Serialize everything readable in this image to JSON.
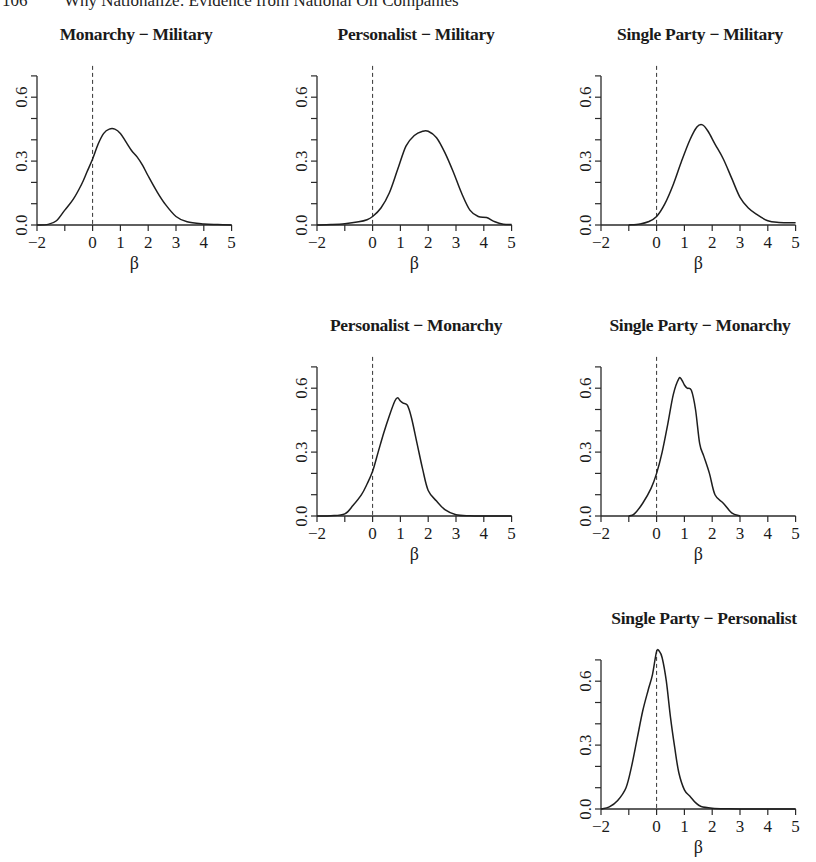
{
  "running_head": {
    "page_number": "106",
    "title": "Why Nationalize: Evidence from National Oil Companies"
  },
  "chart_data": [
    {
      "type": "line",
      "title": "Monarchy − Military",
      "xlabel": "β",
      "ylabel": "",
      "xlim": [
        -2,
        5
      ],
      "ylim": [
        0,
        0.7
      ],
      "xticks": [
        -2,
        -1,
        0,
        1,
        2,
        3,
        4,
        5
      ],
      "xtick_labels": [
        "−2",
        "",
        "0",
        "1",
        "2",
        "3",
        "4",
        "5"
      ],
      "yticks": [
        0.0,
        0.1,
        0.2,
        0.3,
        0.4,
        0.5,
        0.6,
        0.7
      ],
      "ytick_labels": [
        "0.0",
        "",
        "",
        "0.3",
        "",
        "",
        "0.6",
        ""
      ],
      "reference_line_x": 0,
      "x": [
        -2,
        -1.6,
        -1.3,
        -1.0,
        -0.7,
        -0.4,
        -0.2,
        0,
        0.2,
        0.4,
        0.6,
        0.8,
        1.0,
        1.2,
        1.4,
        1.6,
        1.8,
        2.0,
        2.3,
        2.6,
        3.0,
        3.4,
        4.0,
        4.5,
        5.0
      ],
      "y": [
        0.0,
        0.003,
        0.02,
        0.07,
        0.12,
        0.19,
        0.25,
        0.31,
        0.38,
        0.43,
        0.45,
        0.45,
        0.43,
        0.39,
        0.35,
        0.32,
        0.28,
        0.23,
        0.16,
        0.1,
        0.04,
        0.015,
        0.005,
        0.002,
        0.0
      ]
    },
    {
      "type": "line",
      "title": "Personalist − Military",
      "xlabel": "β",
      "ylabel": "",
      "xlim": [
        -2,
        5
      ],
      "ylim": [
        0,
        0.7
      ],
      "xticks": [
        -2,
        -1,
        0,
        1,
        2,
        3,
        4,
        5
      ],
      "xtick_labels": [
        "−2",
        "",
        "0",
        "1",
        "2",
        "3",
        "4",
        "5"
      ],
      "yticks": [
        0.0,
        0.1,
        0.2,
        0.3,
        0.4,
        0.5,
        0.6,
        0.7
      ],
      "ytick_labels": [
        "0.0",
        "",
        "",
        "0.3",
        "",
        "",
        "0.6",
        ""
      ],
      "reference_line_x": 0,
      "x": [
        -2,
        -1.5,
        -1.0,
        -0.5,
        -0.2,
        0,
        0.3,
        0.6,
        0.9,
        1.2,
        1.5,
        1.8,
        2.0,
        2.3,
        2.6,
        2.9,
        3.2,
        3.5,
        3.8,
        4.1,
        4.4,
        4.7,
        5.0
      ],
      "y": [
        0.0,
        0.002,
        0.006,
        0.015,
        0.025,
        0.04,
        0.08,
        0.15,
        0.26,
        0.37,
        0.42,
        0.44,
        0.44,
        0.41,
        0.34,
        0.25,
        0.15,
        0.07,
        0.04,
        0.035,
        0.015,
        0.004,
        0.002
      ]
    },
    {
      "type": "line",
      "title": "Single Party − Military",
      "xlabel": "β",
      "ylabel": "",
      "xlim": [
        -2,
        5
      ],
      "ylim": [
        0,
        0.7
      ],
      "xticks": [
        -2,
        -1,
        0,
        1,
        2,
        3,
        4,
        5
      ],
      "xtick_labels": [
        "−2",
        "",
        "0",
        "1",
        "2",
        "3",
        "4",
        "5"
      ],
      "yticks": [
        0.0,
        0.1,
        0.2,
        0.3,
        0.4,
        0.5,
        0.6,
        0.7
      ],
      "ytick_labels": [
        "0.0",
        "",
        "",
        "0.3",
        "",
        "",
        "0.6",
        ""
      ],
      "reference_line_x": 0,
      "x": [
        -1.0,
        -0.6,
        -0.3,
        0,
        0.3,
        0.6,
        0.9,
        1.2,
        1.45,
        1.65,
        1.85,
        2.1,
        2.4,
        2.7,
        3.0,
        3.3,
        3.6,
        4.0,
        4.4,
        5.0
      ],
      "y": [
        0.0,
        0.005,
        0.015,
        0.04,
        0.1,
        0.19,
        0.3,
        0.4,
        0.46,
        0.47,
        0.44,
        0.38,
        0.31,
        0.22,
        0.13,
        0.08,
        0.05,
        0.02,
        0.012,
        0.01
      ]
    },
    {
      "type": "line",
      "title": "Personalist − Monarchy",
      "xlabel": "β",
      "ylabel": "",
      "xlim": [
        -2,
        5
      ],
      "ylim": [
        0,
        0.7
      ],
      "xticks": [
        -2,
        -1,
        0,
        1,
        2,
        3,
        4,
        5
      ],
      "xtick_labels": [
        "−2",
        "",
        "0",
        "1",
        "2",
        "3",
        "4",
        "5"
      ],
      "yticks": [
        0.0,
        0.1,
        0.2,
        0.3,
        0.4,
        0.5,
        0.6,
        0.7
      ],
      "ytick_labels": [
        "0.0",
        "",
        "",
        "0.3",
        "",
        "",
        "0.6",
        ""
      ],
      "reference_line_x": 0,
      "x": [
        -2,
        -1.5,
        -1.0,
        -0.7,
        -0.4,
        -0.2,
        0,
        0.2,
        0.4,
        0.6,
        0.8,
        0.9,
        1.0,
        1.1,
        1.25,
        1.4,
        1.6,
        1.8,
        2.0,
        2.3,
        2.6,
        3.0,
        3.5,
        4.0,
        5.0
      ],
      "y": [
        0.0,
        0.001,
        0.01,
        0.05,
        0.1,
        0.15,
        0.21,
        0.3,
        0.39,
        0.47,
        0.54,
        0.555,
        0.54,
        0.53,
        0.52,
        0.46,
        0.34,
        0.22,
        0.12,
        0.07,
        0.03,
        0.006,
        0.001,
        0.0,
        0.0
      ]
    },
    {
      "type": "line",
      "title": "Single Party − Monarchy",
      "xlabel": "β",
      "ylabel": "",
      "xlim": [
        -2,
        5
      ],
      "ylim": [
        0,
        0.7
      ],
      "xticks": [
        -2,
        -1,
        0,
        1,
        2,
        3,
        4,
        5
      ],
      "xtick_labels": [
        "−2",
        "",
        "0",
        "1",
        "2",
        "3",
        "4",
        "5"
      ],
      "yticks": [
        0.0,
        0.1,
        0.2,
        0.3,
        0.4,
        0.5,
        0.6,
        0.7
      ],
      "ytick_labels": [
        "0.0",
        "",
        "",
        "0.3",
        "",
        "",
        "0.6",
        ""
      ],
      "reference_line_x": 0,
      "x": [
        -1.0,
        -0.8,
        -0.5,
        -0.2,
        0,
        0.2,
        0.4,
        0.6,
        0.8,
        0.9,
        1.0,
        1.1,
        1.25,
        1.4,
        1.55,
        1.7,
        1.9,
        2.1,
        2.4,
        2.7,
        3.0
      ],
      "y": [
        0.0,
        0.01,
        0.06,
        0.13,
        0.2,
        0.3,
        0.43,
        0.57,
        0.645,
        0.64,
        0.615,
        0.6,
        0.59,
        0.5,
        0.34,
        0.28,
        0.2,
        0.1,
        0.06,
        0.015,
        0.0
      ]
    },
    {
      "type": "line",
      "title": "Single Party − Personalist",
      "xlabel": "β",
      "ylabel": "",
      "xlim": [
        -2,
        5
      ],
      "ylim": [
        0,
        0.7
      ],
      "xticks": [
        -2,
        -1,
        0,
        1,
        2,
        3,
        4,
        5
      ],
      "xtick_labels": [
        "−2",
        "",
        "0",
        "1",
        "2",
        "3",
        "4",
        "5"
      ],
      "yticks": [
        0.0,
        0.1,
        0.2,
        0.3,
        0.4,
        0.5,
        0.6,
        0.7
      ],
      "ytick_labels": [
        "0.0",
        "",
        "",
        "0.3",
        "",
        "",
        "0.6",
        ""
      ],
      "reference_line_x": 0,
      "x": [
        -2,
        -1.7,
        -1.4,
        -1.1,
        -0.9,
        -0.7,
        -0.5,
        -0.3,
        -0.15,
        0,
        0.1,
        0.2,
        0.35,
        0.5,
        0.65,
        0.8,
        1.0,
        1.2,
        1.4,
        1.6,
        2.0,
        2.5,
        3.0,
        5.0
      ],
      "y": [
        0.0,
        0.01,
        0.04,
        0.1,
        0.2,
        0.33,
        0.46,
        0.56,
        0.63,
        0.74,
        0.74,
        0.71,
        0.6,
        0.43,
        0.29,
        0.17,
        0.09,
        0.06,
        0.03,
        0.012,
        0.004,
        0.001,
        0.0,
        0.0
      ]
    }
  ]
}
